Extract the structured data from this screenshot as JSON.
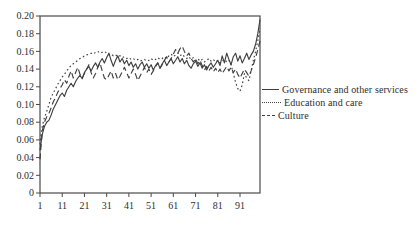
{
  "colors": {
    "background": "#ffffff",
    "line": "#3f3f3f",
    "text": "#2e2e2e",
    "axis": "#4a4a4a"
  },
  "chart_data": {
    "type": "line",
    "title": "",
    "xlabel": "",
    "ylabel": "",
    "xlim": [
      1,
      100
    ],
    "ylim": [
      0,
      0.2
    ],
    "grid": false,
    "frame": "box",
    "legend_position": "right",
    "x_tick_values": [
      1,
      11,
      21,
      31,
      41,
      51,
      61,
      71,
      81,
      91
    ],
    "x_tick_labels": [
      "1",
      "11",
      "21",
      "31",
      "41",
      "51",
      "61",
      "71",
      "81",
      "91"
    ],
    "y_tick_values": [
      0,
      0.02,
      0.04,
      0.06,
      0.08,
      0.1,
      0.12,
      0.14,
      0.16,
      0.18,
      0.2
    ],
    "y_tick_labels": [
      "0",
      "0.02",
      "0.04",
      "0.06",
      "0.08",
      "0.10",
      "0.12",
      "0.14",
      "0.16",
      "0.18",
      "0.20"
    ],
    "series": [
      {
        "name": "Governance and other services",
        "style": "solid",
        "values": [
          0.048,
          0.066,
          0.075,
          0.08,
          0.082,
          0.088,
          0.095,
          0.1,
          0.105,
          0.11,
          0.113,
          0.109,
          0.116,
          0.12,
          0.124,
          0.12,
          0.126,
          0.13,
          0.133,
          0.129,
          0.136,
          0.14,
          0.143,
          0.138,
          0.143,
          0.147,
          0.142,
          0.148,
          0.152,
          0.147,
          0.153,
          0.158,
          0.15,
          0.143,
          0.15,
          0.155,
          0.148,
          0.152,
          0.146,
          0.15,
          0.144,
          0.148,
          0.142,
          0.146,
          0.14,
          0.145,
          0.148,
          0.142,
          0.146,
          0.141,
          0.145,
          0.139,
          0.144,
          0.147,
          0.141,
          0.146,
          0.15,
          0.144,
          0.148,
          0.152,
          0.146,
          0.15,
          0.154,
          0.148,
          0.152,
          0.146,
          0.15,
          0.144,
          0.141,
          0.146,
          0.149,
          0.143,
          0.147,
          0.141,
          0.145,
          0.139,
          0.144,
          0.147,
          0.142,
          0.146,
          0.15,
          0.144,
          0.155,
          0.147,
          0.158,
          0.151,
          0.145,
          0.154,
          0.158,
          0.149,
          0.155,
          0.147,
          0.152,
          0.158,
          0.151,
          0.156,
          0.16,
          0.168,
          0.18,
          0.196
        ]
      },
      {
        "name": "Education and care",
        "style": "dotted",
        "values": [
          0.055,
          0.075,
          0.085,
          0.092,
          0.1,
          0.108,
          0.113,
          0.118,
          0.123,
          0.127,
          0.131,
          0.134,
          0.138,
          0.141,
          0.144,
          0.146,
          0.148,
          0.15,
          0.152,
          0.153,
          0.155,
          0.156,
          0.157,
          0.158,
          0.157,
          0.159,
          0.16,
          0.158,
          0.159,
          0.16,
          0.158,
          0.156,
          0.157,
          0.155,
          0.156,
          0.154,
          0.155,
          0.153,
          0.154,
          0.152,
          0.153,
          0.151,
          0.152,
          0.15,
          0.151,
          0.149,
          0.15,
          0.151,
          0.149,
          0.15,
          0.152,
          0.15,
          0.151,
          0.153,
          0.151,
          0.152,
          0.154,
          0.152,
          0.155,
          0.157,
          0.154,
          0.156,
          0.158,
          0.155,
          0.157,
          0.154,
          0.152,
          0.154,
          0.151,
          0.153,
          0.15,
          0.152,
          0.149,
          0.151,
          0.148,
          0.15,
          0.152,
          0.149,
          0.151,
          0.148,
          0.15,
          0.147,
          0.149,
          0.151,
          0.148,
          0.15,
          0.145,
          0.135,
          0.125,
          0.118,
          0.115,
          0.122,
          0.135,
          0.13,
          0.127,
          0.138,
          0.15,
          0.16,
          0.172,
          0.186
        ]
      },
      {
        "name": "Culture",
        "style": "dashed",
        "values": [
          0.038,
          0.07,
          0.08,
          0.086,
          0.09,
          0.096,
          0.103,
          0.108,
          0.114,
          0.118,
          0.122,
          0.128,
          0.124,
          0.132,
          0.138,
          0.13,
          0.136,
          0.142,
          0.134,
          0.13,
          0.135,
          0.14,
          0.145,
          0.136,
          0.13,
          0.135,
          0.142,
          0.147,
          0.138,
          0.13,
          0.128,
          0.133,
          0.138,
          0.13,
          0.135,
          0.128,
          0.132,
          0.137,
          0.142,
          0.136,
          0.13,
          0.135,
          0.14,
          0.134,
          0.127,
          0.132,
          0.137,
          0.142,
          0.136,
          0.14,
          0.134,
          0.138,
          0.143,
          0.147,
          0.141,
          0.145,
          0.15,
          0.154,
          0.148,
          0.152,
          0.157,
          0.162,
          0.158,
          0.163,
          0.166,
          0.16,
          0.155,
          0.158,
          0.152,
          0.148,
          0.152,
          0.146,
          0.15,
          0.144,
          0.139,
          0.143,
          0.138,
          0.142,
          0.137,
          0.141,
          0.136,
          0.14,
          0.135,
          0.139,
          0.143,
          0.138,
          0.142,
          0.136,
          0.14,
          0.134,
          0.13,
          0.135,
          0.14,
          0.136,
          0.132,
          0.138,
          0.145,
          0.153,
          0.162,
          0.172
        ]
      }
    ]
  }
}
